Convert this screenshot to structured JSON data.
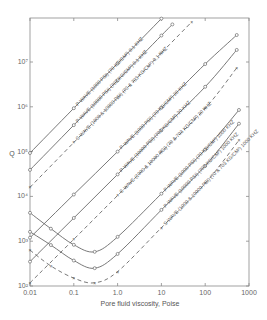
{
  "chart_data": {
    "type": "line",
    "title": "",
    "xlabel": "Pore fluid viscosity, Poise",
    "ylabel": "Q",
    "xscale": "log",
    "yscale": "log",
    "xlim": [
      0.01,
      1000
    ],
    "ylim": [
      100,
      100000000
    ],
    "xticks": [
      {
        "value": 0.01,
        "label": "0.01"
      },
      {
        "value": 0.1,
        "label": "0.1"
      },
      {
        "value": 1,
        "label": "1.0"
      },
      {
        "value": 10,
        "label": "10"
      },
      {
        "value": 100,
        "label": "100"
      },
      {
        "value": 1000,
        "label": "1000"
      }
    ],
    "yticks": [
      {
        "value": 100,
        "label": "10²"
      },
      {
        "value": 1000,
        "label": "10³"
      },
      {
        "value": 10000,
        "label": "10⁴"
      },
      {
        "value": 100000,
        "label": "10⁵"
      },
      {
        "value": 1000000,
        "label": "10⁶"
      },
      {
        "value": 10000000,
        "label": "10⁷"
      }
    ],
    "grid": false,
    "legend": "none (inline curve labels)",
    "series": [
      {
        "name": "P-WAVE (1000 PSI) (70 KG/CM²) 0.1 KHZ",
        "style": "solid",
        "points": [
          [
            0.01,
            93000
          ],
          [
            0.1,
            930000
          ],
          [
            1,
            9300000
          ],
          [
            10,
            93000000
          ]
        ]
      },
      {
        "name": "P-WAVE (10000 PSI) (703 KG/CM²) 0.1 KHZ",
        "style": "solid",
        "points": [
          [
            0.01,
            39000
          ],
          [
            0.1,
            390000
          ],
          [
            1,
            3900000
          ],
          [
            10,
            39000000
          ],
          [
            17.8,
            69000000
          ]
        ]
      },
      {
        "name": "S-WAVE (1000 & 10000 PSI) (70 & 703 KG/CM²) 0.1 KHZ",
        "style": "dashed",
        "points": [
          [
            0.01,
            16000
          ],
          [
            0.1,
            160000
          ],
          [
            1,
            1600000
          ],
          [
            10,
            16000000
          ],
          [
            49,
            78000000
          ]
        ]
      },
      {
        "name": "P-WAVE (1000 PSI) (70 KG/CM²) 20 KHZ",
        "style": "solid",
        "points": [
          [
            0.01,
            1200
          ],
          [
            0.1,
            11000
          ],
          [
            1,
            100000
          ],
          [
            10,
            950000
          ],
          [
            100,
            9000000
          ],
          [
            525,
            40000000
          ]
        ]
      },
      {
        "name": "P-WAVE (10000 PSI) (703 KG/CM²) 20 KHZ",
        "style": "solid",
        "points": [
          [
            0.01,
            350
          ],
          [
            0.1,
            3300
          ],
          [
            1,
            31000
          ],
          [
            10,
            300000
          ],
          [
            100,
            2800000
          ],
          [
            525,
            18600000
          ]
        ]
      },
      {
        "name": "S-WAVE (1000 & 10000 PSI) (70 & 703 KG/CM²) 20 KHZ",
        "style": "dashed",
        "points": [
          [
            0.01,
            118
          ],
          [
            0.1,
            1100
          ],
          [
            1,
            10500
          ],
          [
            10,
            98000
          ],
          [
            100,
            920000
          ],
          [
            525,
            7400000
          ]
        ]
      },
      {
        "name": "P-WAVE (1000 PSI) (70 KG/CM²) 1000 KHZ",
        "style": "solid",
        "points": [
          [
            0.01,
            4300
          ],
          [
            0.03,
            1900
          ],
          [
            0.1,
            830
          ],
          [
            0.3,
            580
          ],
          [
            1,
            1250
          ],
          [
            10,
            11500
          ],
          [
            100,
            110000
          ],
          [
            590,
            850000
          ]
        ]
      },
      {
        "name": "P-WAVE (10000 PSI) (703 KG/CM²) 1000 KHZ",
        "style": "solid",
        "points": [
          [
            0.01,
            1620
          ],
          [
            0.03,
            820
          ],
          [
            0.1,
            370
          ],
          [
            0.3,
            250
          ],
          [
            1,
            520
          ],
          [
            10,
            5000
          ],
          [
            100,
            48000
          ],
          [
            590,
            420000
          ]
        ]
      },
      {
        "name": "S-WAVE (1000 & 10000 PSI) (70 & 703 KG/CM²) 1000 KHZ",
        "style": "dashed",
        "points": [
          [
            0.01,
            630
          ],
          [
            0.03,
            280
          ],
          [
            0.1,
            150
          ],
          [
            0.3,
            118
          ],
          [
            1,
            210
          ],
          [
            10,
            2000
          ],
          [
            100,
            19500
          ],
          [
            590,
            180000
          ]
        ]
      }
    ]
  }
}
